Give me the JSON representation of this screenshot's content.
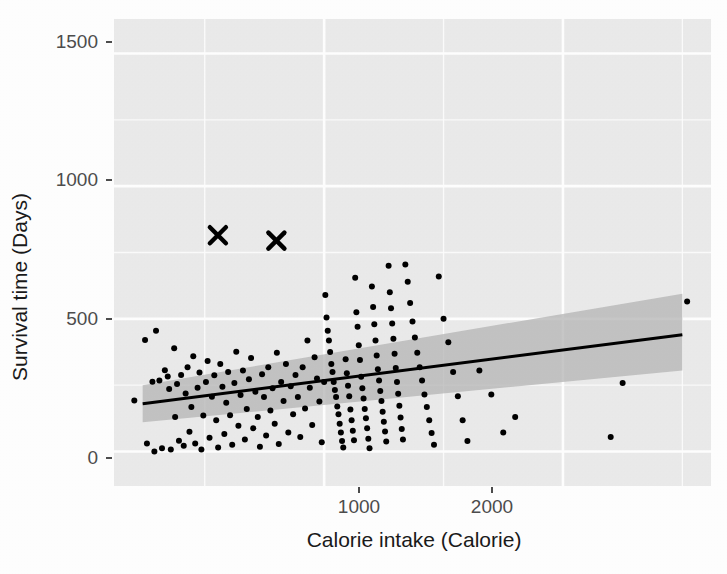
{
  "chart_data": {
    "type": "scatter",
    "title": "",
    "subtitle": "",
    "xlabel": "Calorie intake (Calorie)",
    "ylabel": "Survival time (Days)",
    "xlim": [
      120,
      2620
    ],
    "ylim": [
      -130,
      1630
    ],
    "xticks": [
      1000,
      2000
    ],
    "xtick_labels": [
      "1000",
      "2000"
    ],
    "yticks": [
      0,
      500,
      1000,
      1500
    ],
    "ytick_labels": [
      "0",
      "500",
      "1000",
      "1500"
    ],
    "x_minor_ticks": [
      500,
      1500,
      2500
    ],
    "y_minor_ticks": [
      250,
      750,
      1250
    ],
    "grid": true,
    "grid_color": "#ffffff",
    "panel_background": "#ebebeb",
    "legend": "none",
    "point_color": "#000000",
    "point_size": 6,
    "marker_shape": "circle",
    "series": [
      {
        "name": "observations",
        "marker": "circle",
        "points": [
          [
            205,
            192
          ],
          [
            250,
            420
          ],
          [
            258,
            30
          ],
          [
            281,
            263
          ],
          [
            289,
            0
          ],
          [
            296,
            455
          ],
          [
            310,
            268
          ],
          [
            321,
            12
          ],
          [
            333,
            306
          ],
          [
            345,
            283
          ],
          [
            351,
            236
          ],
          [
            358,
            8
          ],
          [
            372,
            389
          ],
          [
            376,
            130
          ],
          [
            384,
            254
          ],
          [
            392,
            41
          ],
          [
            401,
            288
          ],
          [
            412,
            22
          ],
          [
            420,
            219
          ],
          [
            428,
            318
          ],
          [
            436,
            74
          ],
          [
            444,
            168
          ],
          [
            452,
            359
          ],
          [
            460,
            30
          ],
          [
            470,
            240
          ],
          [
            478,
            298
          ],
          [
            486,
            8
          ],
          [
            494,
            136
          ],
          [
            505,
            262
          ],
          [
            512,
            341
          ],
          [
            520,
            52
          ],
          [
            530,
            206
          ],
          [
            540,
            287
          ],
          [
            548,
            118
          ],
          [
            556,
            15
          ],
          [
            565,
            330
          ],
          [
            574,
            244
          ],
          [
            582,
            66
          ],
          [
            590,
            184
          ],
          [
            598,
            300
          ],
          [
            606,
            137
          ],
          [
            615,
            25
          ],
          [
            624,
            258
          ],
          [
            632,
            376
          ],
          [
            641,
            97
          ],
          [
            650,
            213
          ],
          [
            660,
            305
          ],
          [
            668,
            45
          ],
          [
            676,
            160
          ],
          [
            685,
            272
          ],
          [
            694,
            352
          ],
          [
            703,
            88
          ],
          [
            712,
            225
          ],
          [
            722,
            130
          ],
          [
            731,
            18
          ],
          [
            740,
            291
          ],
          [
            748,
            205
          ],
          [
            757,
            60
          ],
          [
            766,
            318
          ],
          [
            775,
            155
          ],
          [
            784,
            238
          ],
          [
            793,
            105
          ],
          [
            802,
            372
          ],
          [
            810,
            28
          ],
          [
            820,
            262
          ],
          [
            830,
            190
          ],
          [
            840,
            330
          ],
          [
            850,
            72
          ],
          [
            860,
            246
          ],
          [
            870,
            140
          ],
          [
            880,
            288
          ],
          [
            890,
            205
          ],
          [
            900,
            55
          ],
          [
            910,
            318
          ],
          [
            920,
            162
          ],
          [
            930,
            418
          ],
          [
            940,
            240
          ],
          [
            950,
            100
          ],
          [
            960,
            355
          ],
          [
            970,
            275
          ],
          [
            980,
            188
          ],
          [
            990,
            35
          ],
          [
            1000,
            262
          ],
          [
            1005,
            590
          ],
          [
            1010,
            505
          ],
          [
            1015,
            455
          ],
          [
            1020,
            418
          ],
          [
            1025,
            375
          ],
          [
            1030,
            330
          ],
          [
            1035,
            300
          ],
          [
            1040,
            262
          ],
          [
            1045,
            232
          ],
          [
            1050,
            205
          ],
          [
            1055,
            170
          ],
          [
            1060,
            140
          ],
          [
            1065,
            105
          ],
          [
            1070,
            72
          ],
          [
            1075,
            40
          ],
          [
            1080,
            15
          ],
          [
            1090,
            348
          ],
          [
            1095,
            295
          ],
          [
            1100,
            248
          ],
          [
            1105,
            208
          ],
          [
            1110,
            158
          ],
          [
            1115,
            118
          ],
          [
            1120,
            78
          ],
          [
            1125,
            42
          ],
          [
            1130,
            655
          ],
          [
            1135,
            525
          ],
          [
            1140,
            470
          ],
          [
            1145,
            400
          ],
          [
            1150,
            345
          ],
          [
            1155,
            282
          ],
          [
            1160,
            238
          ],
          [
            1165,
            200
          ],
          [
            1170,
            160
          ],
          [
            1175,
            125
          ],
          [
            1180,
            88
          ],
          [
            1185,
            48
          ],
          [
            1190,
            12
          ],
          [
            1200,
            622
          ],
          [
            1205,
            545
          ],
          [
            1210,
            480
          ],
          [
            1215,
            418
          ],
          [
            1220,
            362
          ],
          [
            1225,
            310
          ],
          [
            1230,
            268
          ],
          [
            1235,
            228
          ],
          [
            1240,
            190
          ],
          [
            1245,
            150
          ],
          [
            1250,
            112
          ],
          [
            1255,
            75
          ],
          [
            1260,
            38
          ],
          [
            1270,
            700
          ],
          [
            1275,
            600
          ],
          [
            1280,
            540
          ],
          [
            1285,
            482
          ],
          [
            1290,
            425
          ],
          [
            1295,
            368
          ],
          [
            1300,
            315
          ],
          [
            1305,
            262
          ],
          [
            1310,
            218
          ],
          [
            1315,
            172
          ],
          [
            1320,
            128
          ],
          [
            1325,
            85
          ],
          [
            1330,
            45
          ],
          [
            1340,
            705
          ],
          [
            1350,
            640
          ],
          [
            1360,
            560
          ],
          [
            1370,
            490
          ],
          [
            1380,
            430
          ],
          [
            1390,
            372
          ],
          [
            1400,
            318
          ],
          [
            1410,
            268
          ],
          [
            1420,
            215
          ],
          [
            1430,
            168
          ],
          [
            1440,
            118
          ],
          [
            1450,
            70
          ],
          [
            1460,
            25
          ],
          [
            1480,
            660
          ],
          [
            1500,
            500
          ],
          [
            1520,
            412
          ],
          [
            1540,
            300
          ],
          [
            1560,
            208
          ],
          [
            1580,
            118
          ],
          [
            1600,
            40
          ],
          [
            1650,
            305
          ],
          [
            1700,
            215
          ],
          [
            1750,
            72
          ],
          [
            1800,
            130
          ],
          [
            2200,
            55
          ],
          [
            2250,
            258
          ],
          [
            2520,
            565
          ]
        ]
      },
      {
        "name": "highlighted",
        "marker": "x",
        "points": [
          [
            555,
            815
          ],
          [
            800,
            795
          ]
        ]
      }
    ],
    "fit": {
      "type": "linear-regression",
      "line_color": "#000000",
      "ribbon_color": "#b3b3b3",
      "x_start": 240,
      "x_end": 2500,
      "y_start": 180,
      "y_end": 440,
      "ci_lower_start": 110,
      "ci_upper_start": 250,
      "ci_lower_end": 305,
      "ci_upper_end": 595
    }
  },
  "axes": {
    "y_title": "Survival time (Days)",
    "x_title": "Calorie intake (Calorie)",
    "y_tick_labels": [
      "1500",
      "1000",
      "500",
      "0"
    ],
    "x_tick_labels": [
      "1000",
      "2000"
    ]
  }
}
